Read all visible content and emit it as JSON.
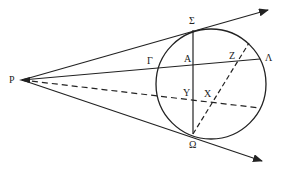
{
  "diagram": {
    "labels": {
      "P": "P",
      "Sigma": "Σ",
      "Gamma": "Γ",
      "A": "A",
      "Z": "Z",
      "Lambda": "Λ",
      "Y": "Y",
      "X": "X",
      "Omega": "Ω"
    },
    "colors": {
      "stroke": "#222222",
      "background": "#ffffff"
    }
  }
}
